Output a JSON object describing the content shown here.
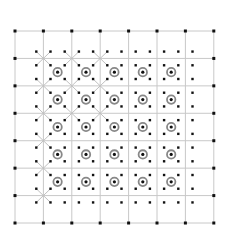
{
  "diagram": {
    "type": "lattice",
    "grid": {
      "columns": 7,
      "rows": 7,
      "origin_px": [
        15,
        31
      ],
      "cell_width_px": 28.4,
      "cell_height_px": 27.43,
      "line_color": "#c8c8c8",
      "vertex_dot_color": "#111111"
    },
    "inner_dots": {
      "columns": 12,
      "rows": 12,
      "start_fraction": 0.75,
      "step_fraction": 0.5,
      "color": "#111111"
    },
    "markers": {
      "description": "circled dots at cell centers",
      "cells": {
        "col_from": 1,
        "col_to": 5,
        "row_from": 1,
        "row_to": 5
      },
      "ring_color": "#888888",
      "center_color": "#111111"
    },
    "crosses": {
      "description": "diagonal X lines at grid vertices connecting to four surrounding dots",
      "color": "#c0c0c0",
      "vertices": [
        [
          1,
          1
        ],
        [
          2,
          1
        ],
        [
          3,
          1
        ],
        [
          1,
          2
        ],
        [
          2,
          2
        ],
        [
          3,
          2
        ],
        [
          1,
          3
        ],
        [
          2,
          3
        ],
        [
          3,
          3
        ],
        [
          1,
          4
        ],
        [
          1,
          5
        ],
        [
          1,
          6
        ]
      ]
    }
  }
}
